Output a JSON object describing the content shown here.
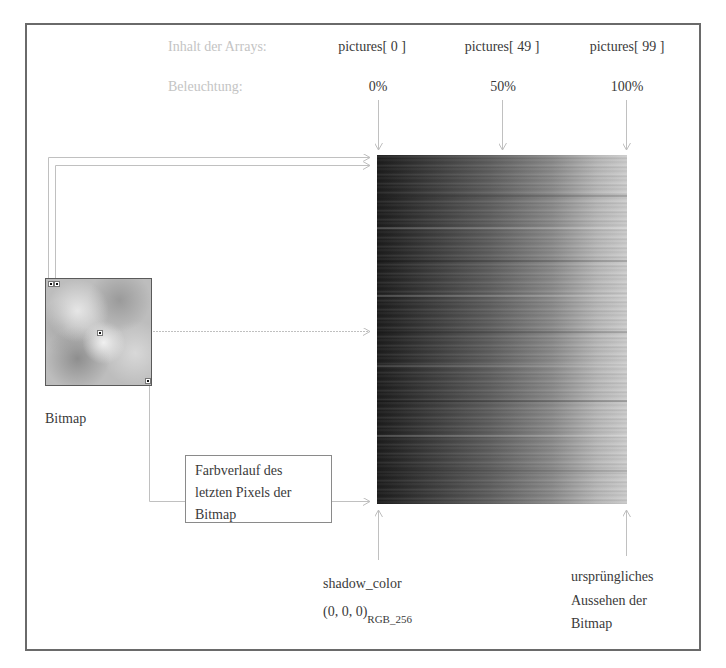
{
  "header": {
    "row1_label": "Inhalt der Arrays:",
    "row2_label": "Beleuchtung:",
    "columns": [
      {
        "array_label": "pictures[ 0 ]",
        "percent": "0%"
      },
      {
        "array_label": "pictures[ 49 ]",
        "percent": "50%"
      },
      {
        "array_label": "pictures[ 99 ]",
        "percent": "100%"
      }
    ]
  },
  "bitmap": {
    "label": "Bitmap"
  },
  "note_box": {
    "lines": [
      "Farbverlauf des",
      "letzten Pixels der",
      "Bitmap"
    ]
  },
  "bottom_left": {
    "line1": "shadow_color",
    "line2": "(0, 0, 0)",
    "subscript": "RGB_256"
  },
  "bottom_right": {
    "lines": [
      "ursprüngliches",
      "Aussehen der",
      "Bitmap"
    ]
  },
  "colors": {
    "frame": "#6a6a6a",
    "arrow_lines": "#bdbdbd",
    "light_label": "#c4c4c4",
    "text": "#3a3a3a",
    "gradient_start": "#1c1c1c",
    "gradient_end": "#cdcdcd"
  }
}
